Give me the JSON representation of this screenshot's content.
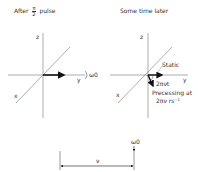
{
  "left_panel": {
    "title_pre": "After",
    "title_frac_num": "π",
    "title_frac_den": "2",
    "title_post": "pulse",
    "axis_z": "z",
    "axis_y": "y",
    "axis_x": "x",
    "omega_label": "ω0"
  },
  "right_panel": {
    "title": "Some time later",
    "axis_z": "z",
    "axis_y": "y",
    "axis_x": "x",
    "static_label": "Static",
    "angle_label": "2πνt",
    "precess_line1": "Precessing at",
    "precess_line2": "2πν rs⁻¹"
  },
  "bottom": {
    "omega_label": "ω0",
    "nu_label": "ν"
  }
}
